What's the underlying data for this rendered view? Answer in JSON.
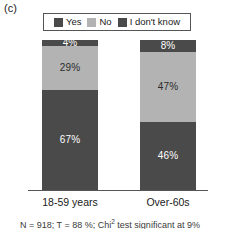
{
  "panel": {
    "label": "(c)"
  },
  "legend": {
    "position": "top-center",
    "items": [
      {
        "label": "Yes",
        "color": "#4a4a4a",
        "swatch_name": "legend-swatch-yes"
      },
      {
        "label": "No",
        "color": "#b3b3b3",
        "swatch_name": "legend-swatch-no"
      },
      {
        "label": "I don't know",
        "color": "#4a4a4a",
        "swatch_name": "legend-swatch-idk"
      }
    ]
  },
  "colors": {
    "yes": "#4a4a4a",
    "no": "#b3b3b3",
    "i_dont_know": "#4a4a4a",
    "axis": "#555555",
    "text": "#1a1a1a",
    "background": "#ffffff"
  },
  "footnote": {
    "text": "N = 918; T = 88 %; Chi  test significant at 9%",
    "clipped": true
  },
  "chart_data": {
    "type": "bar",
    "subtype": "stacked-percentage",
    "title": "",
    "xlabel": "",
    "ylabel": "",
    "ylim": [
      0,
      100
    ],
    "grid": false,
    "legend_position": "top-center",
    "categories": [
      "18-59 years",
      "Over-60s"
    ],
    "series": [
      {
        "name": "I don't know",
        "color": "#4a4a4a",
        "values": [
          4,
          8
        ],
        "labels": [
          "4%",
          "8%"
        ]
      },
      {
        "name": "No",
        "color": "#b3b3b3",
        "values": [
          29,
          47
        ],
        "labels": [
          "29%",
          "47%"
        ]
      },
      {
        "name": "Yes",
        "color": "#4a4a4a",
        "values": [
          67,
          46
        ],
        "labels": [
          "67%",
          "46%"
        ]
      }
    ],
    "stack_order_top_to_bottom": [
      "I don't know",
      "No",
      "Yes"
    ],
    "bars": [
      {
        "category": "18-59 years",
        "segments": [
          {
            "name": "I don't know",
            "value": 4,
            "label": "4%",
            "color": "#4a4a4a"
          },
          {
            "name": "No",
            "value": 29,
            "label": "29%",
            "color": "#b3b3b3"
          },
          {
            "name": "Yes",
            "value": 67,
            "label": "67%",
            "color": "#4a4a4a"
          }
        ]
      },
      {
        "category": "Over-60s",
        "segments": [
          {
            "name": "I don't know",
            "value": 8,
            "label": "8%",
            "color": "#4a4a4a"
          },
          {
            "name": "No",
            "value": 47,
            "label": "47%",
            "color": "#b3b3b3"
          },
          {
            "name": "Yes",
            "value": 46,
            "label": "46%",
            "color": "#4a4a4a"
          }
        ]
      }
    ]
  }
}
